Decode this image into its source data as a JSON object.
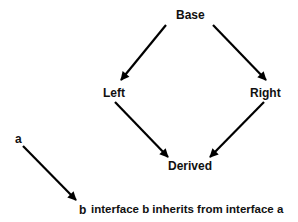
{
  "diagram": {
    "nodes": {
      "base": "Base",
      "left": "Left",
      "right": "Right",
      "derived": "Derived"
    },
    "edges": [
      {
        "from": "Base",
        "to": "Left"
      },
      {
        "from": "Base",
        "to": "Right"
      },
      {
        "from": "Left",
        "to": "Derived"
      },
      {
        "from": "Right",
        "to": "Derived"
      }
    ],
    "legend": {
      "from_label": "a",
      "to_label": "b",
      "description": "interface b inherits from interface a"
    },
    "colors": {
      "arrow": "#000000",
      "text": "#111111",
      "background": "#ffffff"
    }
  }
}
